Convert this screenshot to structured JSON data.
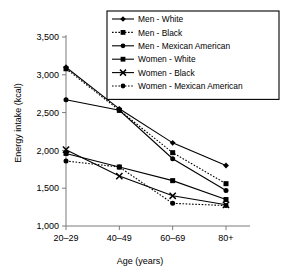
{
  "chart_data": {
    "type": "line",
    "title": "",
    "xlabel": "Age (years)",
    "ylabel": "Energy intake (kcal)",
    "categories": [
      "20–29",
      "40–49",
      "60–69",
      "80+"
    ],
    "ylim": [
      1000,
      3500
    ],
    "yticks": [
      1000,
      1500,
      2000,
      2500,
      3000,
      3500
    ],
    "ytick_labels": [
      "1,000",
      "1,500",
      "2,000",
      "2,500",
      "3,000",
      "3,500"
    ],
    "grid": false,
    "legend_position": "top-right",
    "series": [
      {
        "name": "Men - White",
        "values": [
          3100,
          2550,
          2100,
          1800
        ],
        "marker": "diamond",
        "dash": "solid"
      },
      {
        "name": "Men - Black",
        "values": [
          3080,
          2530,
          1970,
          1560
        ],
        "marker": "square",
        "dash": "dotted"
      },
      {
        "name": "Men - Mexican American",
        "values": [
          2670,
          2530,
          1890,
          1470
        ],
        "marker": "circle",
        "dash": "solid"
      },
      {
        "name": "Women - White",
        "values": [
          1960,
          1780,
          1600,
          1350
        ],
        "marker": "square",
        "dash": "solid"
      },
      {
        "name": "Women - Black",
        "values": [
          2010,
          1660,
          1400,
          1280
        ],
        "marker": "cross",
        "dash": "solid"
      },
      {
        "name": "Women - Mexican American",
        "values": [
          1860,
          1780,
          1300,
          1270
        ],
        "marker": "circle",
        "dash": "dotted"
      }
    ]
  },
  "axes": {
    "ylabel": "Energy intake (kcal)",
    "xlabel": "Age (years)"
  },
  "legend": {
    "items": [
      "Men - White",
      "Men - Black",
      "Men - Mexican American",
      "Women - White",
      "Women - Black",
      "Women - Mexican American"
    ]
  },
  "colors": {
    "line": "#000000",
    "axis": "#7a7a7a",
    "text": "#000000",
    "background": "#ffffff",
    "legend_border": "#000000"
  }
}
